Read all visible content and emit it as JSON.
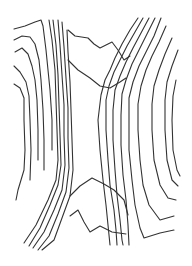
{
  "figure": {
    "description": "Line drawing of contour lines forming an hourglass / saddle shape",
    "width": 192,
    "height": 266,
    "background": "#ffffff",
    "line_color": "#333333",
    "left_contours": [
      "M14,29 L25,26 L35,22 L41,20 L43,26 L46,50 L48,70 L50,90 L52,120 L52,150",
      "M14,40 L22,36 L30,37 L35,44 L39,60 L41,80 L43,110 L44,140 L44,170",
      "M15,52 L22,48 L28,54 L32,66 L35,80 L37,100 L38,130 L38,160",
      "M14,66 L20,72 L26,82 L29,96 L30,120 L31,150 L30,180",
      "M14,84 L20,88 L24,98 L24,120 L25,150 L24,170 L18,190 L16,200",
      "M49,20 L52,40 L55,70 L56,100 L57,130 L58,160 L56,180 L48,200 L36,225 L24,243",
      "M53,20 L56,45 L58,75 L59,105 L60,135 L61,165 L58,185 L50,205 L40,228 L29,246",
      "M58,20 L60,45 L62,75 L64,105 L64,135 L65,165 L62,190 L54,210 L44,232 L33,248",
      "M62,22 L64,47 L66,78 L68,108 L68,138 L69,168 L66,192 L58,214 L49,236 L38,250",
      "M67,30 L68,52 L70,82 L71,110 L72,140 L73,170 L70,196 L62,218 L54,240 L42,250"
    ],
    "right_contours": [
      "M138,18 L130,30 L122,44 L115,58 L110,70 L105,80 L101,95 L98,120 L100,150 L103,180 L106,205 L108,225 L110,245",
      "M143,18 L135,32 L127,46 L120,60 L114,72 L109,86 L106,100 L106,130 L108,160 L110,185 L114,210 L116,230 L117,245",
      "M149,18 L141,33 L133,48 L126,62 L120,76 L115,90 L113,110 L113,140 L115,170 L117,195 L120,220 L122,240 L123,245",
      "M155,18 L147,34 L139,50 L132,64 L126,80 L122,94 L121,115 L121,145 L123,175 L126,200 L128,225 L129,245",
      "M161,18 L154,36 L146,52 L139,66 L133,82 L129,98 L129,120 L129,150 L132,180 L135,205 L140,228 L144,238 L160,233 L174,230",
      "M166,26 L159,42 L152,56 L146,70 L141,86 L138,104 L138,130 L140,160 L143,185 L149,205 L160,220 L174,216",
      "M172,38 L165,54 L159,70 L154,86 L152,104 L152,130 L154,160 L160,185 L168,198 L176,200",
      "M178,50 L172,66 L167,82 L165,100 L165,130 L167,160 L172,180 L178,186",
      "M176,80 L173,96 L172,120 L173,150 L177,170 L180,176"
    ],
    "top_center_contours": [
      "M68,30 L75,36 L88,38 L94,44 L100,48 L112,42 L118,50 L124,60 L130,56",
      "M68,60 L78,70 L90,78 L100,86 L110,88 L120,82 L126,78"
    ],
    "bottom_center_contours": [
      "M70,196 L80,186 L92,178 L104,184 L114,190 L124,200 L128,215",
      "M70,216 L78,210 L84,222 L90,232 L100,226 L112,232 L126,234"
    ]
  }
}
